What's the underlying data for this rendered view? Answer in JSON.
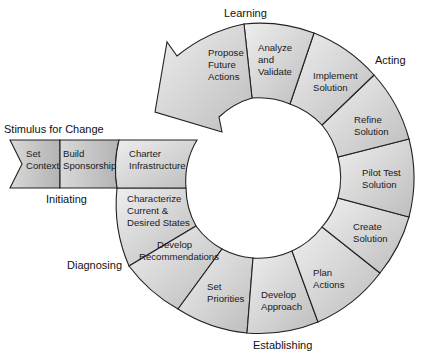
{
  "colors": {
    "segment_light": "#e9e9e9",
    "segment_dark": "#b7b7b7",
    "stroke": "#222222",
    "text": "#1a1a1a"
  },
  "phases": {
    "stimulus": "Stimulus for Change",
    "initiating": "Initiating",
    "diagnosing": "Diagnosing",
    "establishing": "Establishing",
    "acting": "Acting",
    "learning": "Learning"
  },
  "steps": {
    "set_context": [
      "Set",
      "Context"
    ],
    "build_sponsorship": [
      "Build",
      "Sponsorship"
    ],
    "charter_infrastructure": [
      "Charter",
      "Infrastructure"
    ],
    "characterize": [
      "Characterize",
      "Current &",
      "Desired States"
    ],
    "develop_recommendations": [
      "Develop",
      "Recommendations"
    ],
    "set_priorities": [
      "Set",
      "Priorities"
    ],
    "develop_approach": [
      "Develop",
      "Approach"
    ],
    "plan_actions": [
      "Plan",
      "Actions"
    ],
    "create_solution": [
      "Create",
      "Solution"
    ],
    "pilot_test": [
      "Pilot Test",
      "Solution"
    ],
    "refine_solution": [
      "Refine",
      "Solution"
    ],
    "implement_solution": [
      "Implement",
      "Solution"
    ],
    "analyze_validate": [
      "Analyze",
      "and",
      "Validate"
    ],
    "propose_future": [
      "Propose",
      "Future",
      "Actions"
    ]
  }
}
